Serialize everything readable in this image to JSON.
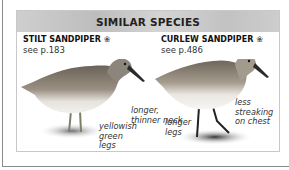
{
  "panel": {
    "title": "SIMILAR SPECIES"
  },
  "species": [
    {
      "name": "STILT SANDPIPER",
      "marker": "❀",
      "ref": "see p.183",
      "notes": [
        "longer, thinner neck",
        "yellowish green legs"
      ],
      "note_lines": {
        "neck": [
          "longer,",
          "thinner neck"
        ],
        "legs": [
          "yellowish",
          "green",
          "legs"
        ]
      }
    },
    {
      "name": "CURLEW SANDPIPER",
      "marker": "❀",
      "ref": "see p.486",
      "notes": [
        "less streaking on chest",
        "longer legs"
      ],
      "note_lines": {
        "chest": [
          "less",
          "streaking",
          "on chest"
        ],
        "legs": [
          "longer",
          "legs"
        ]
      }
    }
  ]
}
